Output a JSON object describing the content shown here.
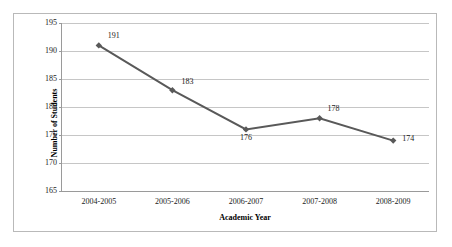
{
  "chart_data": {
    "type": "line",
    "title": "",
    "xlabel": "Academic Year",
    "ylabel": "Number of Students",
    "categories": [
      "2004-2005",
      "2005-2006",
      "2006-2007",
      "2007-2008",
      "2008-2009"
    ],
    "values": [
      191,
      183,
      176,
      178,
      174
    ],
    "point_labels": [
      "191",
      "183",
      "176",
      "178",
      "174"
    ],
    "ylim": [
      165,
      195
    ],
    "yticks": [
      165,
      170,
      175,
      180,
      185,
      190,
      195
    ],
    "ytick_labels": [
      "165",
      "170",
      "175",
      "180",
      "185",
      "190",
      "195"
    ],
    "grid": true,
    "legend": false,
    "series_color": "#595959",
    "grid_color": "#c6c6c6",
    "axis_color": "#9a9a9a",
    "border_color": "#b9b9b9",
    "marker": "diamond"
  }
}
